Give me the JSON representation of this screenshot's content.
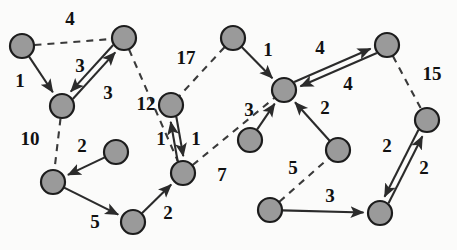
{
  "figure": {
    "type": "directed-weighted-graph",
    "title": "",
    "background_color": "#fbfbfa",
    "node_fill_color": "#9a9a9a",
    "node_stroke_color": "#1c1c1c",
    "edge_color": "#2b2b2b",
    "label_color": "#111111"
  },
  "chart_data": {
    "type": "diagram",
    "title": "",
    "node_radius": 12,
    "nodes": [
      {
        "id": "n1",
        "x": 22,
        "y": 46
      },
      {
        "id": "n2",
        "x": 124,
        "y": 38
      },
      {
        "id": "n3",
        "x": 62,
        "y": 106
      },
      {
        "id": "n4",
        "x": 53,
        "y": 182
      },
      {
        "id": "n5",
        "x": 116,
        "y": 152
      },
      {
        "id": "n6",
        "x": 133,
        "y": 222
      },
      {
        "id": "n7",
        "x": 171,
        "y": 105
      },
      {
        "id": "n8",
        "x": 183,
        "y": 173
      },
      {
        "id": "n9",
        "x": 233,
        "y": 38
      },
      {
        "id": "n10",
        "x": 284,
        "y": 90
      },
      {
        "id": "n11",
        "x": 387,
        "y": 45
      },
      {
        "id": "n12",
        "x": 427,
        "y": 120
      },
      {
        "id": "n13",
        "x": 250,
        "y": 140
      },
      {
        "id": "n14",
        "x": 338,
        "y": 150
      },
      {
        "id": "n15",
        "x": 270,
        "y": 210
      },
      {
        "id": "n16",
        "x": 380,
        "y": 213
      }
    ],
    "edges": [
      {
        "from": "n1",
        "to": "n2",
        "weight": 4,
        "style": "dashed",
        "arrow": false,
        "label_x": 70,
        "label_y": 21
      },
      {
        "from": "n1",
        "to": "n3",
        "weight": 1,
        "style": "solid",
        "arrow": true,
        "label_x": 20,
        "label_y": 83
      },
      {
        "from": "n3",
        "to": "n2",
        "weight": 3,
        "style": "solid",
        "arrow": true,
        "label_x": 80,
        "label_y": 68
      },
      {
        "from": "n2",
        "to": "n3",
        "weight": 3,
        "style": "solid",
        "arrow": true,
        "label_x": 108,
        "label_y": 95
      },
      {
        "from": "n2",
        "to": "n8",
        "weight": 12,
        "style": "dashed",
        "arrow": false,
        "label_x": 146,
        "label_y": 106
      },
      {
        "from": "n3",
        "to": "n4",
        "weight": 10,
        "style": "dashed",
        "arrow": false,
        "label_x": 30,
        "label_y": 141
      },
      {
        "from": "n5",
        "to": "n4",
        "weight": 2,
        "style": "solid",
        "arrow": true,
        "label_x": 82,
        "label_y": 148
      },
      {
        "from": "n4",
        "to": "n6",
        "weight": 5,
        "style": "solid",
        "arrow": true,
        "label_x": 95,
        "label_y": 224
      },
      {
        "from": "n6",
        "to": "n8",
        "weight": 2,
        "style": "solid",
        "arrow": true,
        "label_x": 168,
        "label_y": 215
      },
      {
        "from": "n7",
        "to": "n8",
        "weight": 1,
        "style": "solid",
        "arrow": true,
        "label_x": 161,
        "label_y": 141
      },
      {
        "from": "n8",
        "to": "n7",
        "weight": 1,
        "style": "solid",
        "arrow": true,
        "label_x": 196,
        "label_y": 141
      },
      {
        "from": "n9",
        "to": "n7",
        "weight": 17,
        "style": "dashed",
        "arrow": false,
        "label_x": 186,
        "label_y": 60
      },
      {
        "from": "n9",
        "to": "n10",
        "weight": 1,
        "style": "solid",
        "arrow": true,
        "label_x": 268,
        "label_y": 52
      },
      {
        "from": "n8",
        "to": "n10",
        "weight": 7,
        "style": "dashed",
        "arrow": false,
        "label_x": 222,
        "label_y": 177
      },
      {
        "from": "n10",
        "to": "n11",
        "weight": 4,
        "style": "solid",
        "arrow": true,
        "label_x": 320,
        "label_y": 50
      },
      {
        "from": "n11",
        "to": "n10",
        "weight": 4,
        "style": "solid",
        "arrow": true,
        "label_x": 348,
        "label_y": 86
      },
      {
        "from": "n11",
        "to": "n12",
        "weight": 15,
        "style": "dashed",
        "arrow": false,
        "label_x": 432,
        "label_y": 76
      },
      {
        "from": "n13",
        "to": "n10",
        "weight": 3,
        "style": "solid",
        "arrow": true,
        "label_x": 249,
        "label_y": 112
      },
      {
        "from": "n14",
        "to": "n10",
        "weight": 2,
        "style": "solid",
        "arrow": true,
        "label_x": 325,
        "label_y": 110
      },
      {
        "from": "n15",
        "to": "n14",
        "weight": 5,
        "style": "dashed",
        "arrow": false,
        "label_x": 293,
        "label_y": 170
      },
      {
        "from": "n15",
        "to": "n16",
        "weight": 3,
        "style": "solid",
        "arrow": true,
        "label_x": 330,
        "label_y": 198
      },
      {
        "from": "n16",
        "to": "n12",
        "weight": 2,
        "style": "solid",
        "arrow": true,
        "label_x": 387,
        "label_y": 148
      },
      {
        "from": "n12",
        "to": "n16",
        "weight": 2,
        "style": "solid",
        "arrow": true,
        "label_x": 424,
        "label_y": 170
      }
    ]
  }
}
